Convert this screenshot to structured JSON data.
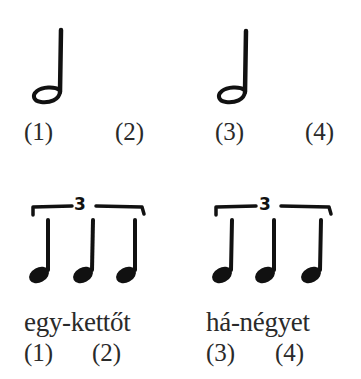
{
  "row1": {
    "notes": [
      {
        "type": "half-note",
        "beat": 1
      },
      {
        "type": "half-note",
        "beat": 3
      }
    ],
    "labels": [
      "(1)",
      "(2)",
      "(3)",
      "(4)"
    ]
  },
  "row2": {
    "groups": [
      {
        "type": "quarter-note-triplet",
        "tuplet_number": "3",
        "syllables": "egy-kettőt",
        "labels": [
          "(1)",
          "(2)"
        ]
      },
      {
        "type": "quarter-note-triplet",
        "tuplet_number": "3",
        "syllables": "há-négyet",
        "labels": [
          "(3)",
          "(4)"
        ]
      }
    ]
  },
  "colors": {
    "ink": "#111111",
    "text": "#2a2a2a",
    "background": "#ffffff"
  }
}
